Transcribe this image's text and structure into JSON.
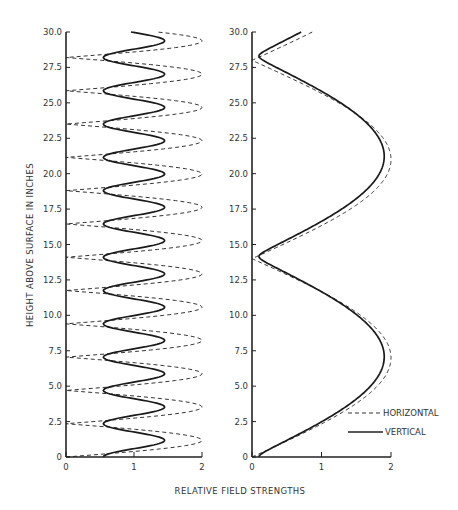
{
  "chart_data": [
    {
      "type": "line",
      "panel": "left",
      "title": "",
      "xlabel": "RELATIVE FIELD STRENGTHS",
      "ylabel": "HEIGHT ABOVE SURFACE IN INCHES",
      "xlim": [
        0,
        2
      ],
      "ylim": [
        0,
        30
      ],
      "x_ticks": [
        "0",
        "1",
        "2"
      ],
      "y_ticks": [
        "0",
        "2.5",
        "5.0",
        "7.5",
        "10.0",
        "12.5",
        "15.0",
        "17.5",
        "20.0",
        "22.5",
        "25.0",
        "27.5",
        "30.0"
      ],
      "grid": false,
      "orientation": "height on y-axis, field strength on x-axis",
      "model": {
        "horizontal_period_in": 4.7,
        "vertical_period_in": 2.35,
        "vertical_mean": 1.0,
        "vertical_swing": 0.45,
        "horizontal_peak": 2.0
      },
      "series": [
        {
          "name": "HORIZONTAL",
          "style": "dashed",
          "height": [
            0,
            1.175,
            2.35,
            3.525,
            4.7,
            5.875,
            7.05,
            8.225,
            9.4,
            10.575,
            11.75,
            12.925,
            14.1,
            15.275,
            16.45,
            17.625,
            18.8,
            19.975,
            21.15,
            22.325,
            23.5,
            24.675,
            25.85,
            27.025,
            28.2,
            29.375,
            30.0
          ],
          "value": [
            0,
            2.0,
            0,
            2.0,
            0,
            2.0,
            0,
            2.0,
            0,
            2.0,
            0,
            2.0,
            0,
            2.0,
            0,
            2.0,
            0,
            2.0,
            0,
            2.0,
            0,
            2.0,
            0,
            2.0,
            0,
            2.0,
            1.7
          ]
        },
        {
          "name": "VERTICAL",
          "style": "solid",
          "height": [
            0,
            1.175,
            2.35,
            3.525,
            4.7,
            5.875,
            7.05,
            8.225,
            9.4,
            10.575,
            11.75,
            12.925,
            14.1,
            15.275,
            16.45,
            17.625,
            18.8,
            19.975,
            21.15,
            22.325,
            23.5,
            24.675,
            25.85,
            27.025,
            28.2,
            29.375,
            30.0
          ],
          "value": [
            0.55,
            1.45,
            0.55,
            1.45,
            0.55,
            1.45,
            0.55,
            1.45,
            0.55,
            1.45,
            0.55,
            1.45,
            0.55,
            1.45,
            0.55,
            1.45,
            0.55,
            1.45,
            0.55,
            1.45,
            0.55,
            1.45,
            0.55,
            1.45,
            0.55,
            1.45,
            1.0
          ]
        }
      ]
    },
    {
      "type": "line",
      "panel": "right",
      "title": "",
      "xlabel": "RELATIVE FIELD STRENGTHS",
      "ylabel": "",
      "xlim": [
        0,
        2
      ],
      "ylim": [
        0,
        30
      ],
      "x_ticks": [
        "0",
        "1",
        "2"
      ],
      "y_ticks": [
        "0",
        "2.5",
        "5.0",
        "7.5",
        "10.0",
        "12.5",
        "15.0",
        "17.5",
        "20.0",
        "22.5",
        "25.0",
        "27.5",
        "30.0"
      ],
      "grid": false,
      "legend_position": "lower right",
      "model": {
        "horizontal_null_spacing_in": 14.0,
        "horizontal_peak": 2.0,
        "vertical_null_spacing_in": 14.15,
        "vertical_peak": 1.9,
        "vertical_floor": 0.1
      },
      "series": [
        {
          "name": "HORIZONTAL",
          "style": "dashed",
          "height": [
            0,
            2.5,
            5.0,
            7.0,
            7.5,
            10.0,
            12.5,
            14.0,
            15.0,
            17.5,
            20.0,
            21.0,
            22.5,
            25.0,
            27.5,
            28.0,
            30.0
          ],
          "value": [
            0,
            1.07,
            1.81,
            2.0,
            1.99,
            1.56,
            0.66,
            0,
            0.44,
            1.41,
            1.95,
            2.0,
            1.9,
            1.41,
            0.22,
            0,
            0.44
          ]
        },
        {
          "name": "VERTICAL",
          "style": "solid",
          "height": [
            0,
            2.5,
            5.0,
            7.1,
            7.5,
            10.0,
            12.5,
            14.15,
            15.0,
            17.5,
            20.0,
            21.2,
            22.5,
            25.0,
            27.5,
            28.3,
            30.0
          ],
          "value": [
            0.1,
            1.02,
            1.71,
            1.9,
            1.89,
            1.52,
            0.72,
            0.1,
            0.38,
            1.3,
            1.83,
            1.9,
            1.84,
            1.4,
            0.31,
            0.1,
            0.42
          ]
        }
      ]
    }
  ],
  "labels": {
    "ylabel": "HEIGHT ABOVE SURFACE IN INCHES",
    "xlabel": "RELATIVE FIELD STRENGTHS",
    "legend_horizontal": "HORIZONTAL",
    "legend_vertical": "VERTICAL"
  },
  "colors": {
    "ink": "#2a2a2a",
    "background": "#ffffff"
  }
}
